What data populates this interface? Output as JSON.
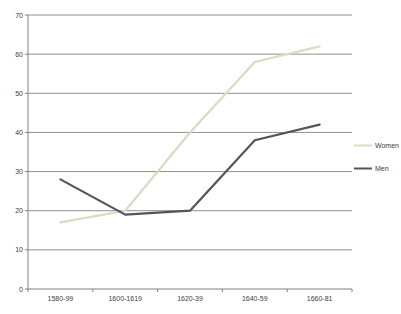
{
  "chart_data": {
    "type": "line",
    "title": "",
    "xlabel": "",
    "ylabel": "",
    "categories": [
      "1580-99",
      "1600-1619",
      "1620-39",
      "1640-59",
      "1660-81"
    ],
    "series": [
      {
        "name": "Women",
        "values": [
          17,
          20,
          40,
          58,
          62
        ],
        "color": "#d8dcc0"
      },
      {
        "name": "Men",
        "values": [
          28,
          19,
          20,
          38,
          42
        ],
        "color": "#54545e"
      }
    ],
    "ylim": [
      0,
      70
    ],
    "y_tick_step": 10,
    "y_tick_labels": [
      "0",
      "10",
      "20",
      "30",
      "40",
      "50",
      "60",
      "70"
    ],
    "grid": true,
    "legend_position": "right",
    "legend": [
      "Women",
      "Men"
    ]
  },
  "colors": {
    "background": "#ffffff",
    "gridline": "#909090",
    "axis": "#808080",
    "label_text": "#3d3d3d",
    "women_line": "#d8dcc0",
    "men_line": "#54545e"
  }
}
